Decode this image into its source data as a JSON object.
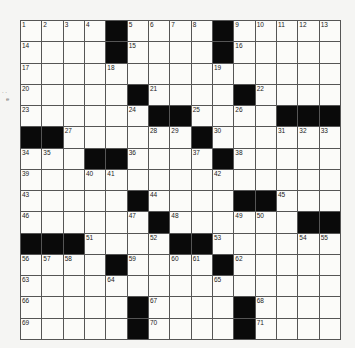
{
  "puzzle": {
    "size": 15,
    "rows": [
      [
        "1",
        "2",
        "3",
        "4",
        "#",
        "5",
        "6",
        "7",
        "8",
        "#",
        "9",
        "10",
        "11",
        "12",
        "13"
      ],
      [
        "14",
        "",
        "",
        "",
        "#",
        "15",
        "",
        "",
        "",
        "#",
        "16",
        "",
        "",
        "",
        ""
      ],
      [
        "17",
        "",
        "",
        "",
        "18",
        "",
        "",
        "",
        "",
        "19",
        "",
        "",
        "",
        "",
        ""
      ],
      [
        "20",
        "",
        "",
        "",
        "",
        "#",
        "21",
        "",
        "",
        "",
        "#",
        "22",
        "",
        "",
        ""
      ],
      [
        "23",
        "",
        "",
        "",
        "",
        "24",
        "#",
        "#",
        "25",
        "",
        "26",
        "",
        "#",
        "#",
        "#"
      ],
      [
        "#",
        "#",
        "27",
        "",
        "",
        "",
        "28",
        "29",
        "#",
        "30",
        "",
        "",
        "31",
        "32",
        "33"
      ],
      [
        "34",
        "35",
        "",
        "#",
        "#",
        "36",
        "",
        "",
        "37",
        "#",
        "38",
        "",
        "",
        "",
        ""
      ],
      [
        "39",
        "",
        "",
        "40",
        "41",
        "",
        "",
        "",
        "",
        "42",
        "",
        "",
        "",
        "",
        ""
      ],
      [
        "43",
        "",
        "",
        "",
        "",
        "#",
        "44",
        "",
        "",
        "",
        "#",
        "#",
        "45",
        "",
        ""
      ],
      [
        "46",
        "",
        "",
        "",
        "",
        "47",
        "#",
        "48",
        "",
        "",
        "49",
        "50",
        "",
        "#",
        "#"
      ],
      [
        "#",
        "#",
        "#",
        "51",
        "",
        "",
        "52",
        "#",
        "#",
        "53",
        "",
        "",
        "",
        "54",
        "55"
      ],
      [
        "56",
        "57",
        "58",
        "",
        "#",
        "59",
        "",
        "60",
        "61",
        "#",
        "62",
        "",
        "",
        "",
        ""
      ],
      [
        "63",
        "",
        "",
        "",
        "64",
        "",
        "",
        "",
        "",
        "65",
        "",
        "",
        "",
        "",
        ""
      ],
      [
        "66",
        "",
        "",
        "",
        "",
        "#",
        "67",
        "",
        "",
        "",
        "#",
        "68",
        "",
        "",
        ""
      ],
      [
        "69",
        "",
        "",
        "",
        "",
        "#",
        "70",
        "",
        "",
        "",
        "#",
        "71",
        "",
        "",
        ""
      ]
    ]
  },
  "margin": {
    "left_marks": ". .",
    "left_glyph": "e"
  }
}
